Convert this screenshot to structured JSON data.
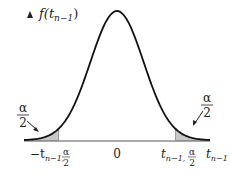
{
  "chart_data": {
    "type": "area",
    "title": "",
    "y_axis_label": {
      "prefix": "f(t",
      "sub": "n−1",
      "suffix": ")"
    },
    "x_axis_label": {
      "base": "t",
      "sub": "n−1"
    },
    "xlim": [
      -3.5,
      3.5
    ],
    "critical_value": 2.2,
    "ticks": [
      {
        "id": "neg-crit",
        "x": -2.2,
        "text": "−t",
        "sub": "n−1,",
        "frac_num": "α",
        "frac_den": "2"
      },
      {
        "id": "zero",
        "x": 0,
        "text": "0"
      },
      {
        "id": "pos-crit",
        "x": 2.2,
        "text": "t",
        "sub": "n−1,",
        "frac_num": "α",
        "frac_den": "2"
      }
    ],
    "annotations": [
      {
        "id": "left-tail",
        "num": "α",
        "den": "2",
        "points_to_x": -2.7
      },
      {
        "id": "right-tail",
        "num": "α",
        "den": "2",
        "points_to_x": 2.7
      }
    ],
    "shaded_regions": [
      {
        "from": -3.5,
        "to": -2.2
      },
      {
        "from": 2.2,
        "to": 3.5
      }
    ],
    "colors": {
      "curve": "#111111",
      "shade": "#c8c8c8",
      "axis": "#555555"
    }
  }
}
